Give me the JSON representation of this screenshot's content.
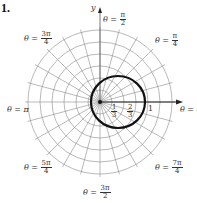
{
  "problem_number": "1.",
  "axis": {
    "y_label": "y"
  },
  "angle_labels": {
    "theta_pi_over_2": {
      "prefix": "θ =",
      "num": "π",
      "den": "2"
    },
    "theta_pi_over_4": {
      "prefix": "θ =",
      "num": "π",
      "den": "4"
    },
    "theta_3pi_over_4": {
      "prefix": "θ =",
      "num": "3π",
      "den": "4"
    },
    "theta_pi": {
      "text": "θ = π"
    },
    "theta_0": {
      "text": "θ = 0"
    },
    "theta_5pi_over_4": {
      "prefix": "θ =",
      "num": "5π",
      "den": "4"
    },
    "theta_7pi_over_4": {
      "prefix": "θ =",
      "num": "7π",
      "den": "4"
    },
    "theta_3pi_over_2": {
      "prefix": "θ =",
      "num": "3π",
      "den": "2"
    }
  },
  "radial_labels": [
    {
      "num": "1",
      "den": "3"
    },
    {
      "num": "2",
      "den": "3"
    },
    {
      "text": "1"
    }
  ],
  "colors": {
    "grid": "#888888",
    "curve": "#111111",
    "axis": "#222222"
  }
}
